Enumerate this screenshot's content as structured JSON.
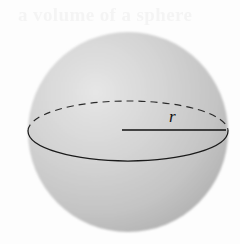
{
  "figure": {
    "name": "sphere-with-radius",
    "caption_visible": false,
    "background_color": "#fdfdfd",
    "width": 240,
    "height": 244
  },
  "labels": {
    "radius": "r"
  },
  "artifact": {
    "ghost_text": "a volume of a sphere",
    "description": "faint scanner bleed-through text across top, illegible"
  },
  "geometry": {
    "sphere": {
      "center_x": 128,
      "center_y": 132,
      "radius": 100,
      "fill_light": "#e2e2e2",
      "fill_mid": "#c8c8c8",
      "fill_dark": "#a6a6a6"
    },
    "equator": {
      "center_x": 128,
      "center_y": 131,
      "radius_x": 100,
      "radius_y": 30,
      "front_style": "solid",
      "back_style": "dashed",
      "stroke_color": "#1f1f1f"
    },
    "radius_line": {
      "x1": 122,
      "y1": 130,
      "x2": 226,
      "y2": 130,
      "stroke_color": "#111111",
      "stroke_width": 1.6
    }
  }
}
